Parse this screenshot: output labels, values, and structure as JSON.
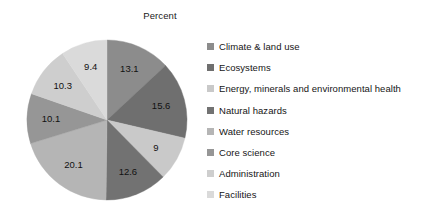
{
  "chart_data": {
    "type": "pie",
    "title": "Percent",
    "xlabel": "",
    "ylabel": "",
    "grid": false,
    "legend_position": "right",
    "start_angle_deg": 0,
    "direction": "clockwise",
    "units": "percent",
    "categories": [
      "Climate & land use",
      "Ecosystems",
      "Energy, minerals and environmental health",
      "Natural hazards",
      "Water resources",
      "Core science",
      "Administration",
      "Facilities"
    ],
    "values": [
      13.1,
      15.6,
      9,
      12.6,
      20.1,
      10.1,
      10.3,
      9.4
    ],
    "value_labels": [
      "13.1",
      "15.6",
      "9",
      "12.6",
      "20.1",
      "10.1",
      "10.3",
      "9.4"
    ],
    "colors": [
      "#8c8c8c",
      "#6f6f6f",
      "#c9c9c9",
      "#727272",
      "#b5b5b5",
      "#969696",
      "#cecece",
      "#dadada"
    ],
    "total": 100.2
  },
  "legend": {
    "items": [
      {
        "label": "Climate & land use",
        "color": "#8c8c8c"
      },
      {
        "label": "Ecosystems",
        "color": "#6f6f6f"
      },
      {
        "label": "Energy, minerals and environmental health",
        "color": "#c9c9c9"
      },
      {
        "label": "Natural hazards",
        "color": "#727272"
      },
      {
        "label": "Water resources",
        "color": "#b5b5b5"
      },
      {
        "label": "Core science",
        "color": "#969696"
      },
      {
        "label": "Administration",
        "color": "#cecece"
      },
      {
        "label": "Facilities",
        "color": "#dadada"
      }
    ]
  },
  "geometry": {
    "center_x": 87,
    "center_y": 94,
    "radius": 80,
    "label_radius": 56
  }
}
